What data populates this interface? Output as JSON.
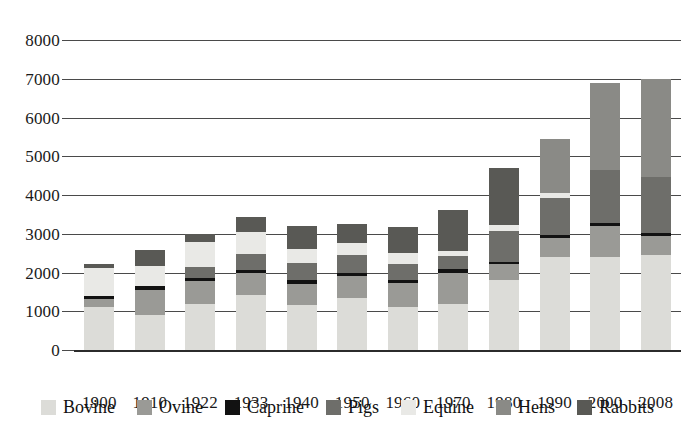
{
  "chart_data": {
    "type": "bar",
    "subtype": "stacked-bar",
    "title": "",
    "xlabel": "",
    "ylabel": "",
    "ylim": [
      0,
      8000
    ],
    "ytick_step": 1000,
    "yticks": [
      "0",
      "1000",
      "2000",
      "3000",
      "4000",
      "5000",
      "6000",
      "7000",
      "8000"
    ],
    "grid": true,
    "legend_position": "bottom",
    "categories": [
      "1900",
      "1910",
      "1922",
      "1933",
      "1940",
      "1950",
      "1960",
      "1970",
      "1980",
      "1990",
      "2000",
      "2008"
    ],
    "series": [
      {
        "name": "Bovine",
        "color": "#dcdcd8",
        "values": [
          1100,
          900,
          1180,
          1430,
          1150,
          1350,
          1120,
          1180,
          1800,
          2400,
          2400,
          2450
        ]
      },
      {
        "name": "Ovine",
        "color": "#9a9a96",
        "values": [
          215,
          660,
          600,
          560,
          560,
          560,
          600,
          820,
          420,
          480,
          800,
          500
        ]
      },
      {
        "name": "Caprine",
        "color": "#121212",
        "values": [
          80,
          90,
          90,
          80,
          100,
          90,
          80,
          100,
          60,
          80,
          70,
          80
        ]
      },
      {
        "name": "Pigs",
        "color": "#6e6e6a",
        "values": [
          0,
          0,
          280,
          410,
          430,
          440,
          420,
          320,
          800,
          960,
          1380,
          1430
        ]
      },
      {
        "name": "Equine",
        "color": "#e9e9e6",
        "values": [
          720,
          510,
          630,
          560,
          360,
          330,
          280,
          140,
          150,
          120,
          0,
          0
        ]
      },
      {
        "name": "Hens",
        "color": "#8a8a86",
        "values": [
          0,
          0,
          0,
          0,
          0,
          0,
          0,
          0,
          0,
          1400,
          2250,
          2540
        ]
      },
      {
        "name": "Rabbits",
        "color": "#595955",
        "values": [
          100,
          430,
          220,
          380,
          600,
          480,
          680,
          1050,
          1480,
          0,
          0,
          0
        ]
      }
    ],
    "totals": [
      2215,
      2590,
      3000,
      3420,
      3200,
      3250,
      3180,
      3610,
      4710,
      5440,
      6900,
      7000
    ]
  },
  "legend": {
    "items": [
      {
        "label": "Bovine",
        "color": "#dcdcd8"
      },
      {
        "label": "Ovine",
        "color": "#9a9a96"
      },
      {
        "label": "Caprine",
        "color": "#121212"
      },
      {
        "label": "Pigs",
        "color": "#6e6e6a"
      },
      {
        "label": "Equine",
        "color": "#e9e9e6"
      },
      {
        "label": "Hens",
        "color": "#8a8a86"
      },
      {
        "label": "Rabbits",
        "color": "#595955"
      }
    ]
  },
  "axes": {
    "y_max": 8000,
    "gridline_color": "#4a4a4a",
    "baseline_color": "#2b2b2b"
  }
}
